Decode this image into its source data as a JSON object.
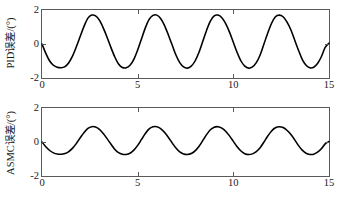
{
  "figure": {
    "background_color": "#ffffff",
    "line_color": "#000000",
    "axis_color": "#5a5a5a"
  },
  "chart_data": [
    {
      "type": "line",
      "id": "pid-error",
      "title": "",
      "xlabel": "",
      "ylabel": "PID误差/(°)",
      "xlim": [
        0,
        15
      ],
      "ylim": [
        -2,
        2
      ],
      "xticks": [
        0,
        5,
        10,
        15
      ],
      "xticklabels": [
        "0",
        "5",
        "10",
        "15"
      ],
      "yticks": [
        2,
        0,
        -2
      ],
      "yticklabels": [
        "2",
        "0",
        "-2"
      ],
      "grid": false,
      "legend": null,
      "series": [
        {
          "name": "PID误差",
          "description": "准周期振荡, 周期约3 s, 峰值约+1.7°, 谷值约-1.4°",
          "period": 3.0,
          "peak_value": 1.7,
          "trough_value": -1.4,
          "peak_times": [
            2.5,
            5.35,
            8.4,
            11.4,
            14.4
          ],
          "trough_times": [
            1.0,
            3.9,
            6.95,
            9.9,
            12.95
          ],
          "x": [
            0.0,
            0.2,
            0.4,
            0.6,
            0.8,
            1.0,
            1.2,
            1.4,
            1.6,
            1.8,
            2.0,
            2.2,
            2.4,
            2.6,
            2.8,
            3.0,
            3.2,
            3.4,
            3.6,
            3.8,
            4.0,
            4.2,
            4.4,
            4.6,
            4.8,
            5.0,
            5.2,
            5.4,
            5.6,
            5.8,
            6.0,
            6.2,
            6.4,
            6.6,
            6.8,
            7.0,
            7.2,
            7.4,
            7.6,
            7.8,
            8.0,
            8.2,
            8.4,
            8.6,
            8.8,
            9.0,
            9.2,
            9.4,
            9.6,
            9.8,
            10.0,
            10.2,
            10.4,
            10.6,
            10.8,
            11.0,
            11.2,
            11.4,
            11.6,
            11.8,
            12.0,
            12.2,
            12.4,
            12.6,
            12.8,
            13.0,
            13.2,
            13.4,
            13.6,
            13.8,
            14.0,
            14.2,
            14.4,
            14.6,
            14.8,
            15.0
          ],
          "y": [
            0.0,
            -0.55,
            -1.0,
            -1.25,
            -1.37,
            -1.4,
            -1.33,
            -1.1,
            -0.7,
            -0.15,
            0.45,
            1.05,
            1.52,
            1.7,
            1.66,
            1.4,
            0.95,
            0.4,
            -0.2,
            -0.75,
            -1.18,
            -1.38,
            -1.4,
            -1.25,
            -0.9,
            -0.35,
            0.3,
            0.95,
            1.45,
            1.68,
            1.7,
            1.5,
            1.1,
            0.55,
            -0.05,
            -0.65,
            -1.1,
            -1.35,
            -1.42,
            -1.3,
            -1.0,
            -0.5,
            0.15,
            0.8,
            1.35,
            1.65,
            1.7,
            1.55,
            1.2,
            0.7,
            0.1,
            -0.5,
            -1.0,
            -1.3,
            -1.42,
            -1.35,
            -1.1,
            -0.65,
            0.0,
            0.65,
            1.22,
            1.6,
            1.7,
            1.6,
            1.3,
            0.85,
            0.25,
            -0.35,
            -0.9,
            -1.25,
            -1.4,
            -1.37,
            -1.15,
            -0.75,
            -0.2,
            0.05
          ]
        }
      ]
    },
    {
      "type": "line",
      "id": "asmc-error",
      "title": "",
      "xlabel": "",
      "ylabel": "ASMC误差/(°)",
      "xlim": [
        0,
        15
      ],
      "ylim": [
        -2,
        2
      ],
      "xticks": [
        0,
        5,
        10,
        15
      ],
      "xticklabels": [
        "0",
        "5",
        "10",
        "15"
      ],
      "yticks": [
        2,
        0,
        -2
      ],
      "yticklabels": [
        "2",
        "0",
        "-2"
      ],
      "grid": false,
      "legend": null,
      "series": [
        {
          "name": "ASMC误差",
          "description": "准周期振荡, 周期约3 s, 峰值约+0.9°, 谷值约-0.72°",
          "period": 3.0,
          "peak_value": 0.9,
          "trough_value": -0.72,
          "peak_times": [
            2.5,
            5.4,
            8.45,
            11.45,
            14.45
          ],
          "trough_times": [
            1.05,
            4.0,
            7.0,
            10.0,
            13.0
          ],
          "x": [
            0.0,
            0.2,
            0.4,
            0.6,
            0.8,
            1.0,
            1.2,
            1.4,
            1.6,
            1.8,
            2.0,
            2.2,
            2.4,
            2.6,
            2.8,
            3.0,
            3.2,
            3.4,
            3.6,
            3.8,
            4.0,
            4.2,
            4.4,
            4.6,
            4.8,
            5.0,
            5.2,
            5.4,
            5.6,
            5.8,
            6.0,
            6.2,
            6.4,
            6.6,
            6.8,
            7.0,
            7.2,
            7.4,
            7.6,
            7.8,
            8.0,
            8.2,
            8.4,
            8.6,
            8.8,
            9.0,
            9.2,
            9.4,
            9.6,
            9.8,
            10.0,
            10.2,
            10.4,
            10.6,
            10.8,
            11.0,
            11.2,
            11.4,
            11.6,
            11.8,
            12.0,
            12.2,
            12.4,
            12.6,
            12.8,
            13.0,
            13.2,
            13.4,
            13.6,
            13.8,
            14.0,
            14.2,
            14.4,
            14.6,
            14.8,
            15.0
          ],
          "y": [
            0.0,
            -0.28,
            -0.5,
            -0.64,
            -0.71,
            -0.72,
            -0.68,
            -0.56,
            -0.36,
            -0.08,
            0.25,
            0.56,
            0.8,
            0.9,
            0.88,
            0.74,
            0.5,
            0.2,
            -0.12,
            -0.42,
            -0.63,
            -0.72,
            -0.73,
            -0.66,
            -0.48,
            -0.2,
            0.15,
            0.5,
            0.77,
            0.89,
            0.9,
            0.79,
            0.57,
            0.28,
            -0.05,
            -0.35,
            -0.58,
            -0.7,
            -0.73,
            -0.68,
            -0.52,
            -0.26,
            0.08,
            0.43,
            0.72,
            0.87,
            0.9,
            0.82,
            0.63,
            0.36,
            0.04,
            -0.28,
            -0.53,
            -0.69,
            -0.74,
            -0.7,
            -0.57,
            -0.34,
            0.0,
            0.35,
            0.65,
            0.84,
            0.9,
            0.85,
            0.69,
            0.45,
            0.14,
            -0.2,
            -0.48,
            -0.66,
            -0.73,
            -0.72,
            -0.6,
            -0.4,
            -0.11,
            0.03
          ]
        }
      ]
    }
  ]
}
